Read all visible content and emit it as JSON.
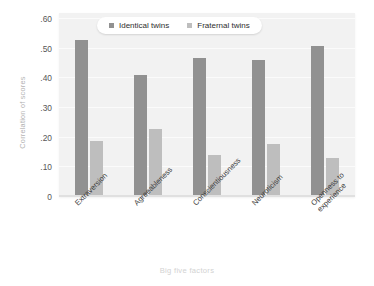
{
  "chart_data": {
    "type": "bar",
    "title": "",
    "xlabel": "Big five factors",
    "ylabel": "Correlation of scores",
    "categories": [
      "Extraversion",
      "Agreeableness",
      "Conscientiousness",
      "Neuroticism",
      "Openness to\nexperience"
    ],
    "series": [
      {
        "name": "Identical twins",
        "color": "#919191",
        "values": [
          0.53,
          0.41,
          0.47,
          0.46,
          0.51
        ]
      },
      {
        "name": "Fraternal twins",
        "color": "#bebebe",
        "values": [
          0.19,
          0.23,
          0.14,
          0.18,
          0.13
        ]
      }
    ],
    "ylim": [
      0,
      0.62
    ],
    "yticks": [
      0,
      0.1,
      0.2,
      0.3,
      0.4,
      0.5,
      0.6
    ],
    "ytick_labels": [
      "0",
      ".10",
      ".20",
      ".30",
      ".40",
      ".50",
      ".60"
    ],
    "grid": true,
    "legend_position": "top-center",
    "plot_background": "#f2f2f2"
  }
}
